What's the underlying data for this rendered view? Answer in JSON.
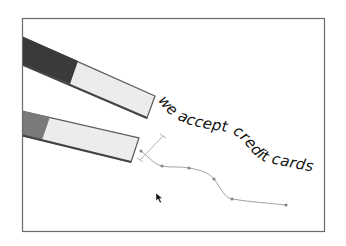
{
  "illustration": {
    "frame": {
      "x": 22,
      "y": 18,
      "width": 302,
      "height": 213,
      "stroke": "#6b6b6b"
    },
    "text_on_path": {
      "text": "we accept credit cards",
      "path": "M 158 100 C 172 125, 200 128, 228 132 C 248 138, 250 160, 270 163 C 285 166, 300 170, 318 172",
      "color": "#111111"
    },
    "magnets": [
      {
        "name": "upper-magnet",
        "body_color": "#ececec",
        "pole_color": "#3a3a3a",
        "outline": "#555555"
      },
      {
        "name": "lower-magnet",
        "body_color": "#ececec",
        "pole_color": "#7a7a7a",
        "outline": "#555555"
      }
    ],
    "bezier_path": {
      "stroke": "#999999",
      "anchor_color": "#888888",
      "anchors": [
        {
          "x": 141,
          "y": 151
        },
        {
          "x": 162,
          "y": 166
        },
        {
          "x": 189,
          "y": 168
        },
        {
          "x": 214,
          "y": 179
        },
        {
          "x": 232,
          "y": 199
        },
        {
          "x": 286,
          "y": 205
        }
      ],
      "handle": {
        "x1": 163,
        "y1": 136,
        "x2": 140,
        "y2": 160
      }
    },
    "cursor": {
      "x": 156,
      "y": 193,
      "icon": "arrow-pointer"
    }
  }
}
